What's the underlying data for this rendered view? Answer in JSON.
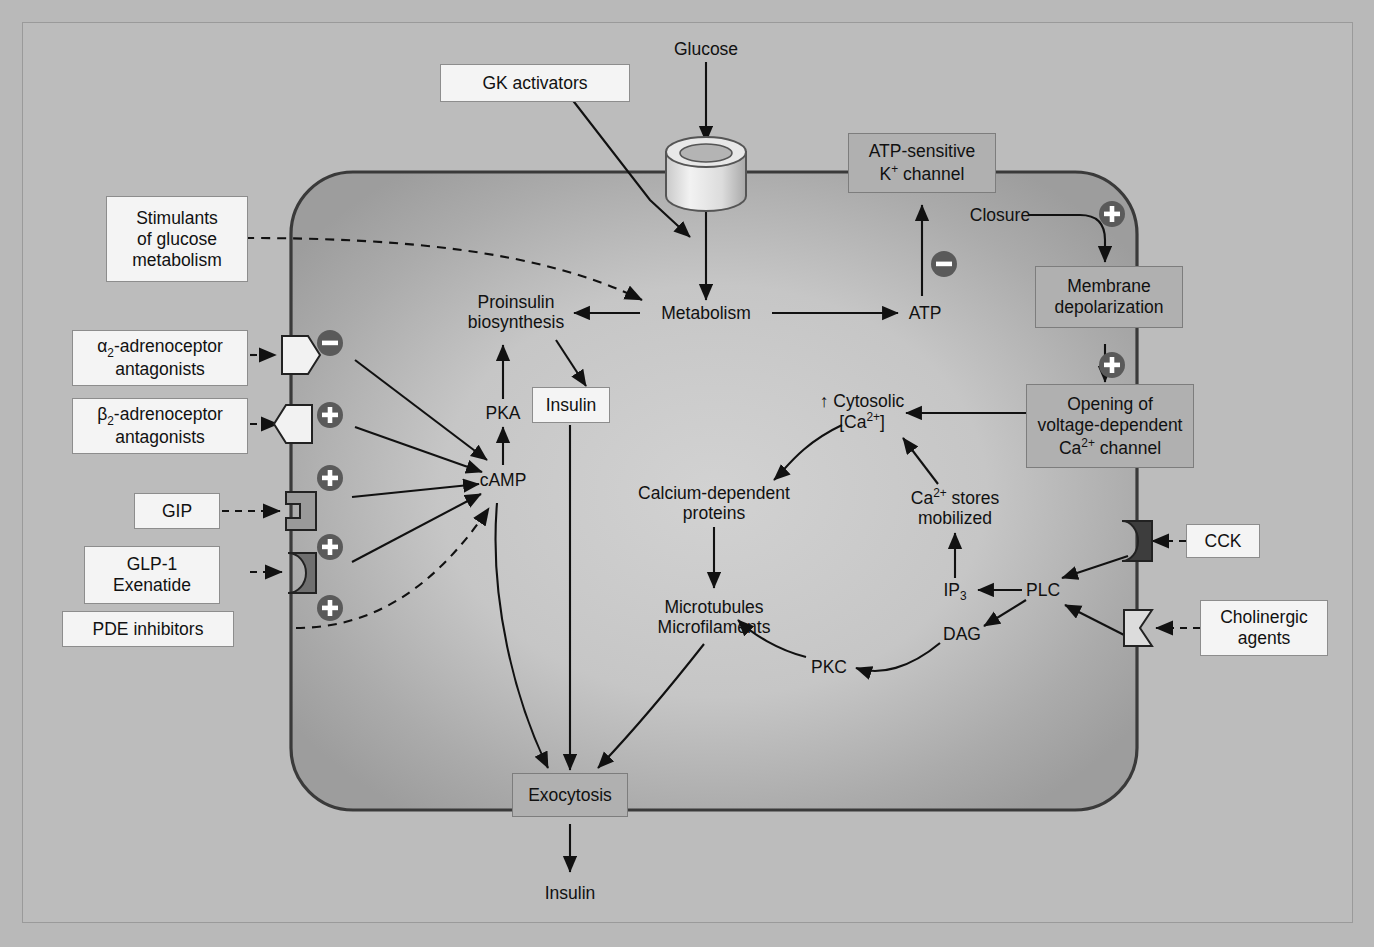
{
  "figure": {
    "background": "#bcbcbc",
    "membrane_color": "#3a3a3a",
    "symbol_circle_color": "#5a5a5a"
  },
  "external_labels": {
    "glucose": "Glucose",
    "gk_activators": "GK activators",
    "stimulants": "Stimulants\nof glucose\nmetabolism",
    "alpha2": "α2-adrenoceptor\nantagonists",
    "beta2": "β2-adrenoceptor\nantagonists",
    "gip": "GIP",
    "glp1": "GLP-1\nExenatide",
    "pde": "PDE inhibitors",
    "cck": "CCK",
    "cholinergic": "Cholinergic\nagents",
    "insulin_out": "Insulin"
  },
  "membrane_boxes": {
    "katp_channel": "ATP-sensitive\nK+ channel",
    "membrane_depolarization": "Membrane\ndepolarization",
    "ca_channel": "Opening of\nvoltage-dependent\nCa2+ channel",
    "exocytosis": "Exocytosis"
  },
  "intracellular_nodes": {
    "metabolism": "Metabolism",
    "atp": "ATP",
    "closure": "Closure",
    "proinsulin": "Proinsulin\nbiosynthesis",
    "pka": "PKA",
    "camp": "cAMP",
    "insulin_box": "Insulin",
    "cytosolic_ca": "↑ Cytosolic\n[Ca2+]",
    "ca_stores": "Ca2+ stores\nmobilized",
    "calcium_proteins": "Calcium-dependent\nproteins",
    "microtubules": "Microtubules\nMicrofilaments",
    "ip3": "IP3",
    "dag": "DAG",
    "plc": "PLC",
    "pkc": "PKC"
  },
  "modulator_symbols": [
    {
      "name": "alpha2-inhibition",
      "sign": "−",
      "x": 330,
      "y": 343
    },
    {
      "name": "beta2-stimulation",
      "sign": "+",
      "x": 330,
      "y": 415
    },
    {
      "name": "gip-stimulation",
      "sign": "+",
      "x": 330,
      "y": 478
    },
    {
      "name": "glp1-stimulation",
      "sign": "+",
      "x": 330,
      "y": 547
    },
    {
      "name": "pde-stimulation",
      "sign": "+",
      "x": 330,
      "y": 608
    },
    {
      "name": "atp-inhibits-katp",
      "sign": "−",
      "x": 944,
      "y": 264
    },
    {
      "name": "closure-depolarization",
      "sign": "+",
      "x": 1112,
      "y": 214
    },
    {
      "name": "depolarization-ca-channel",
      "sign": "+",
      "x": 1112,
      "y": 365
    }
  ],
  "receptors": [
    {
      "name": "alpha2-receptor",
      "shape": "hexagon",
      "fill": "#f2f2f2"
    },
    {
      "name": "beta2-receptor",
      "shape": "pentagon",
      "fill": "#f2f2f2"
    },
    {
      "name": "gip-receptor",
      "shape": "notched-block",
      "fill": "#9a9a9a"
    },
    {
      "name": "glp1-receptor",
      "shape": "crescent-block",
      "fill": "#6f6f6f"
    },
    {
      "name": "cck-receptor",
      "shape": "notched-block",
      "fill": "#3d3d3d"
    },
    {
      "name": "cholinergic-receptor",
      "shape": "notched-block",
      "fill": "#dcdcdc"
    }
  ],
  "transporter": {
    "name": "glucose-transporter",
    "shape": "cylinder"
  }
}
